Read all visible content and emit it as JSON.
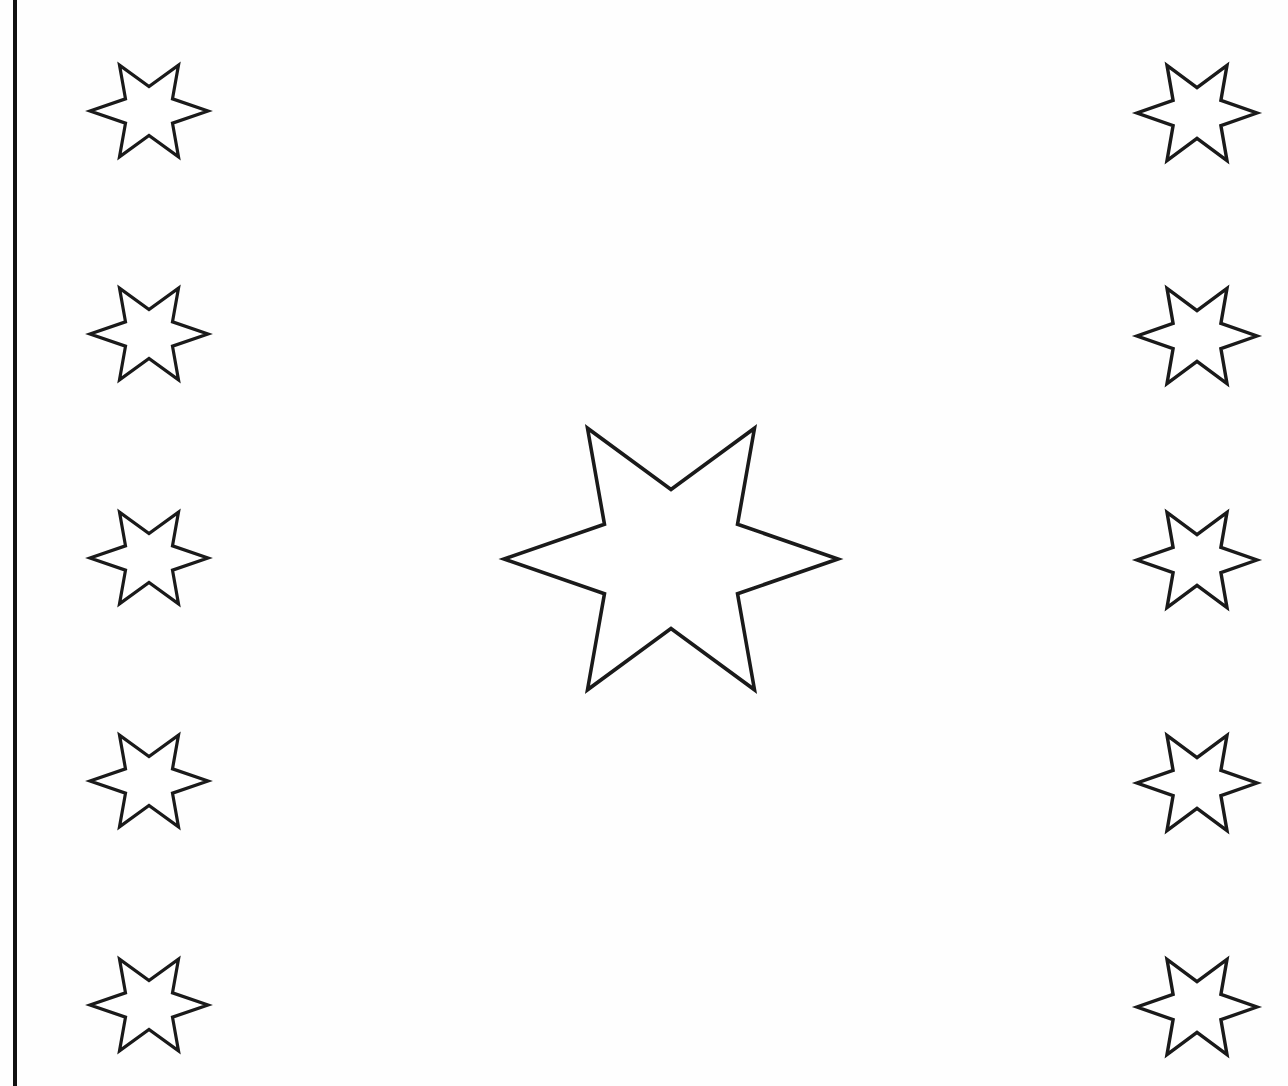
{
  "page": {
    "width": 1288,
    "height": 1086,
    "background_color": "#fefefe",
    "ink_color": "#1a1a1a",
    "fill_color": "#ffffff"
  },
  "border": {
    "name": "left-vertical-rule",
    "color": "#111111",
    "x": 15,
    "y_start": 0,
    "y_end": 1086,
    "thickness": 4
  },
  "star_geometry": {
    "points": 6,
    "outer_radius_ratio": 1.0,
    "inner_radius_ratio": 0.46,
    "rotation_degrees": 0,
    "description": "six-pointed star with tips at left, right, and four diagonals"
  },
  "shapes": [
    {
      "name": "star-left-1",
      "group": "left-column",
      "index": 1,
      "cx": 149,
      "cy": 111,
      "rx": 59,
      "ry": 53,
      "stroke_width": 3.2
    },
    {
      "name": "star-left-2",
      "group": "left-column",
      "index": 2,
      "cx": 149,
      "cy": 334,
      "rx": 59,
      "ry": 53,
      "stroke_width": 3.2
    },
    {
      "name": "star-left-3",
      "group": "left-column",
      "index": 3,
      "cx": 149,
      "cy": 558,
      "rx": 59,
      "ry": 53,
      "stroke_width": 3.2
    },
    {
      "name": "star-left-4",
      "group": "left-column",
      "index": 4,
      "cx": 149,
      "cy": 781,
      "rx": 59,
      "ry": 53,
      "stroke_width": 3.2
    },
    {
      "name": "star-left-5",
      "group": "left-column",
      "index": 5,
      "cx": 149,
      "cy": 1005,
      "rx": 59,
      "ry": 53,
      "stroke_width": 3.2
    },
    {
      "name": "star-right-1",
      "group": "right-column",
      "index": 1,
      "cx": 1197,
      "cy": 113,
      "rx": 60,
      "ry": 55,
      "stroke_width": 3.4
    },
    {
      "name": "star-right-2",
      "group": "right-column",
      "index": 2,
      "cx": 1197,
      "cy": 336,
      "rx": 60,
      "ry": 55,
      "stroke_width": 3.4
    },
    {
      "name": "star-right-3",
      "group": "right-column",
      "index": 3,
      "cx": 1197,
      "cy": 560,
      "rx": 60,
      "ry": 55,
      "stroke_width": 3.4
    },
    {
      "name": "star-right-4",
      "group": "right-column",
      "index": 4,
      "cx": 1197,
      "cy": 783,
      "rx": 60,
      "ry": 55,
      "stroke_width": 3.4
    },
    {
      "name": "star-right-5",
      "group": "right-column",
      "index": 5,
      "cx": 1197,
      "cy": 1007,
      "rx": 60,
      "ry": 55,
      "stroke_width": 3.4
    },
    {
      "name": "star-center-large",
      "group": "center",
      "index": 1,
      "cx": 671,
      "cy": 559,
      "rx": 167,
      "ry": 151,
      "stroke_width": 3.6
    }
  ]
}
